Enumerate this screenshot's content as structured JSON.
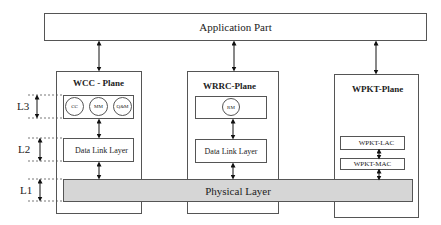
{
  "diagram": {
    "application": {
      "label": "Application Part"
    },
    "planes": [
      {
        "title": "WCC - Plane",
        "l3_circles": [
          "CC",
          "MM",
          "Q&M"
        ],
        "l2_label": "Data Link Layer"
      },
      {
        "title": "WRRC-Plane",
        "l3_circles": [
          "RM"
        ],
        "l2_label": "Data Link Layer"
      },
      {
        "title": "WPKT-Plane",
        "upper_label": "WPKT-LAC",
        "lower_label": "WPKT-MAC"
      }
    ],
    "physical": {
      "label": "Physical Layer",
      "fill": "#d6d6d6"
    },
    "layers": [
      "L3",
      "L2",
      "L1"
    ],
    "colors": {
      "line": "#555555",
      "arrow": "#111111",
      "background": "#ffffff"
    }
  }
}
